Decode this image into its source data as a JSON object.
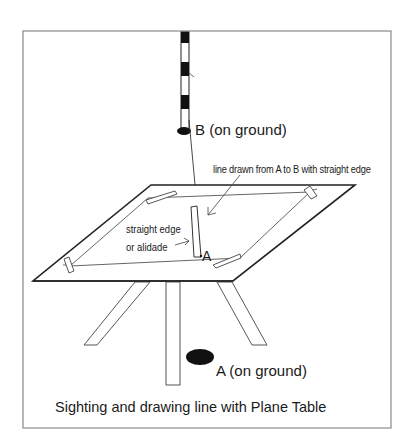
{
  "figure": {
    "caption": "Sighting and drawing line with Plane Table",
    "labels": {
      "station_b": "B (on ground)",
      "line_drawn": "line drawn from A to B with straight edge",
      "straight_edge_line1": "straight edge",
      "straight_edge_line2": "or alidade",
      "point_a_on_board": "A",
      "station_a": "A (on ground)"
    },
    "elements": [
      "ranging-rod at B",
      "ground mark B",
      "sight line from A to B",
      "plane table board",
      "drawing paper with four clips",
      "straight edge / alidade",
      "tripod with three legs",
      "ground mark A"
    ],
    "colors": {
      "line": "#2a2a2a",
      "frame": "#8a8a8a",
      "fill_dark": "#111111",
      "background": "#ffffff"
    }
  }
}
